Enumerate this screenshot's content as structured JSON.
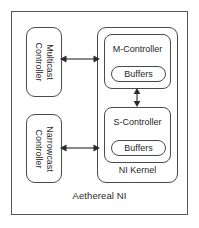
{
  "diagram": {
    "title": "Aethereal NI",
    "outer": {
      "label": "Aethereal NI"
    },
    "controllers": [
      {
        "name": "multicast-controller",
        "line1": "Multicast",
        "line2": "Controller",
        "orientation": "vertical-rotated-90"
      },
      {
        "name": "narrowcast-controller",
        "line1": "Narrowcast",
        "line2": "Controller",
        "orientation": "vertical-rotated-90"
      }
    ],
    "kernel": {
      "label": "NI Kernel",
      "blocks": [
        {
          "name": "m-controller",
          "title": "M-Controller",
          "buffers_label": "Buffers"
        },
        {
          "name": "s-controller",
          "title": "S-Controller",
          "buffers_label": "Buffers"
        }
      ]
    },
    "connections": [
      {
        "name": "multicast-to-kernel",
        "from": "Multicast Controller",
        "to": "NI Kernel",
        "style": "double-headed-arrow",
        "direction": "horizontal"
      },
      {
        "name": "narrowcast-to-kernel",
        "from": "Narrowcast Controller",
        "to": "NI Kernel",
        "style": "double-headed-arrow",
        "direction": "horizontal"
      },
      {
        "name": "m-controller-to-s-controller",
        "from": "M-Controller",
        "to": "S-Controller",
        "style": "double-headed-arrow",
        "direction": "vertical"
      }
    ],
    "colors": {
      "stroke": "#4a4a4a",
      "outer_stroke": "#555555",
      "text": "#1f1f1f",
      "background": "#ffffff"
    }
  }
}
